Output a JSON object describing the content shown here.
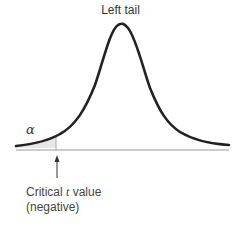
{
  "title": "Left tail",
  "alpha_label": "α",
  "critical_label": {
    "line1_prefix": "Critical ",
    "line1_var": "t",
    "line1_suffix": " value",
    "line2": "(negative)"
  },
  "colors": {
    "curve": "#222222",
    "baseline": "#999999",
    "shade": "#e6e6e6",
    "arrow": "#333333"
  }
}
